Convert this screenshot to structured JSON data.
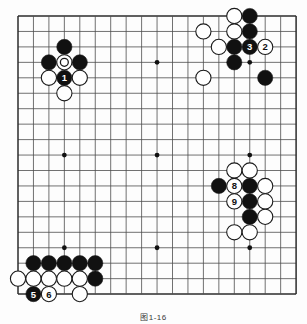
{
  "figure": {
    "kind": "go-board-diagram",
    "caption": "图1-16",
    "board_size": 19,
    "colors": {
      "black_stone": "#111111",
      "white_stone": "#ffffff",
      "stone_outline": "#1a1a1a",
      "grid_line": "#4d4d4d",
      "border_line": "#2b2b2b",
      "star_point": "#111111",
      "background": "#fdfdfd",
      "black_label_text": "#ffffff",
      "white_label_text": "#111111"
    },
    "geometry": {
      "board_left": 18,
      "board_top": 16,
      "cell": 15.45,
      "stone_radius": 7.6,
      "star_radius": 2.4,
      "star_points": [
        [
          3,
          3
        ],
        [
          9,
          3
        ],
        [
          15,
          3
        ],
        [
          3,
          9
        ],
        [
          9,
          9
        ],
        [
          15,
          9
        ],
        [
          3,
          15
        ],
        [
          9,
          15
        ],
        [
          15,
          15
        ]
      ]
    }
  },
  "stones": [
    {
      "id": "w-top-1",
      "color": "white",
      "col": 14,
      "row": 0,
      "label": "",
      "marked": false
    },
    {
      "id": "b-top-1",
      "color": "black",
      "col": 15,
      "row": 0,
      "label": "",
      "marked": false
    },
    {
      "id": "w-top-2",
      "color": "white",
      "col": 12,
      "row": 1,
      "label": "",
      "marked": false
    },
    {
      "id": "w-top-3",
      "color": "white",
      "col": 14,
      "row": 1,
      "label": "",
      "marked": false
    },
    {
      "id": "b-top-2",
      "color": "black",
      "col": 15,
      "row": 1,
      "label": "",
      "marked": false
    },
    {
      "id": "w-top-4",
      "color": "white",
      "col": 13,
      "row": 2,
      "label": "",
      "marked": false
    },
    {
      "id": "b-top-3",
      "color": "black",
      "col": 14,
      "row": 2,
      "label": "",
      "marked": false
    },
    {
      "id": "b-move-3",
      "color": "black",
      "col": 15,
      "row": 2,
      "label": "3",
      "marked": false
    },
    {
      "id": "w-move-2",
      "color": "white",
      "col": 16,
      "row": 2,
      "label": "2",
      "marked": false
    },
    {
      "id": "b-top-4",
      "color": "black",
      "col": 14,
      "row": 3,
      "label": "",
      "marked": false
    },
    {
      "id": "w-top-5",
      "color": "white",
      "col": 12,
      "row": 4,
      "label": "",
      "marked": false
    },
    {
      "id": "b-top-5",
      "color": "black",
      "col": 16,
      "row": 4,
      "label": "",
      "marked": false
    },
    {
      "id": "b-left-1",
      "color": "black",
      "col": 3,
      "row": 2,
      "label": "",
      "marked": false
    },
    {
      "id": "b-left-2",
      "color": "black",
      "col": 2,
      "row": 3,
      "label": "",
      "marked": false
    },
    {
      "id": "w-left-m",
      "color": "white",
      "col": 3,
      "row": 3,
      "label": "",
      "marked": true
    },
    {
      "id": "b-left-3",
      "color": "black",
      "col": 4,
      "row": 3,
      "label": "",
      "marked": false
    },
    {
      "id": "w-left-1",
      "color": "white",
      "col": 2,
      "row": 4,
      "label": "",
      "marked": false
    },
    {
      "id": "b-move-1",
      "color": "black",
      "col": 3,
      "row": 4,
      "label": "1",
      "marked": false
    },
    {
      "id": "w-left-2",
      "color": "white",
      "col": 4,
      "row": 4,
      "label": "",
      "marked": false
    },
    {
      "id": "w-left-3",
      "color": "white",
      "col": 3,
      "row": 5,
      "label": "",
      "marked": false
    },
    {
      "id": "w-right-1",
      "color": "white",
      "col": 14,
      "row": 10,
      "label": "",
      "marked": false
    },
    {
      "id": "w-right-2",
      "color": "white",
      "col": 15,
      "row": 10,
      "label": "",
      "marked": false
    },
    {
      "id": "b-right-1",
      "color": "black",
      "col": 13,
      "row": 11,
      "label": "",
      "marked": false
    },
    {
      "id": "w-move-8",
      "color": "white",
      "col": 14,
      "row": 11,
      "label": "8",
      "marked": false
    },
    {
      "id": "b-right-2",
      "color": "black",
      "col": 15,
      "row": 11,
      "label": "",
      "marked": false
    },
    {
      "id": "w-right-3",
      "color": "white",
      "col": 16,
      "row": 11,
      "label": "",
      "marked": false
    },
    {
      "id": "w-move-9",
      "color": "white",
      "col": 14,
      "row": 12,
      "label": "9",
      "marked": false
    },
    {
      "id": "b-right-3",
      "color": "black",
      "col": 15,
      "row": 12,
      "label": "",
      "marked": false
    },
    {
      "id": "w-right-4",
      "color": "white",
      "col": 16,
      "row": 12,
      "label": "",
      "marked": false
    },
    {
      "id": "b-right-4",
      "color": "black",
      "col": 15,
      "row": 13,
      "label": "",
      "marked": false
    },
    {
      "id": "w-right-5",
      "color": "white",
      "col": 16,
      "row": 13,
      "label": "",
      "marked": false
    },
    {
      "id": "w-right-6",
      "color": "white",
      "col": 14,
      "row": 14,
      "label": "",
      "marked": false
    },
    {
      "id": "w-right-7",
      "color": "white",
      "col": 15,
      "row": 14,
      "label": "",
      "marked": false
    },
    {
      "id": "b-bot-1",
      "color": "black",
      "col": 1,
      "row": 16,
      "label": "",
      "marked": false
    },
    {
      "id": "b-bot-2",
      "color": "black",
      "col": 2,
      "row": 16,
      "label": "",
      "marked": false
    },
    {
      "id": "b-bot-3",
      "color": "black",
      "col": 3,
      "row": 16,
      "label": "",
      "marked": false
    },
    {
      "id": "b-bot-4",
      "color": "black",
      "col": 4,
      "row": 16,
      "label": "",
      "marked": false
    },
    {
      "id": "b-bot-5",
      "color": "black",
      "col": 5,
      "row": 16,
      "label": "",
      "marked": false
    },
    {
      "id": "w-bot-1",
      "color": "white",
      "col": 0,
      "row": 17,
      "label": "",
      "marked": false
    },
    {
      "id": "w-bot-2",
      "color": "white",
      "col": 1,
      "row": 17,
      "label": "",
      "marked": false
    },
    {
      "id": "w-bot-3",
      "color": "white",
      "col": 2,
      "row": 17,
      "label": "",
      "marked": false
    },
    {
      "id": "w-bot-4",
      "color": "white",
      "col": 3,
      "row": 17,
      "label": "",
      "marked": false
    },
    {
      "id": "w-bot-5",
      "color": "white",
      "col": 4,
      "row": 17,
      "label": "",
      "marked": false
    },
    {
      "id": "b-bot-6",
      "color": "black",
      "col": 5,
      "row": 17,
      "label": "",
      "marked": false
    },
    {
      "id": "b-move-5",
      "color": "black",
      "col": 1,
      "row": 18,
      "label": "5",
      "marked": false
    },
    {
      "id": "w-move-6",
      "color": "white",
      "col": 2,
      "row": 18,
      "label": "6",
      "marked": false
    },
    {
      "id": "w-bot-6",
      "color": "white",
      "col": 4,
      "row": 18,
      "label": "",
      "marked": false
    }
  ]
}
